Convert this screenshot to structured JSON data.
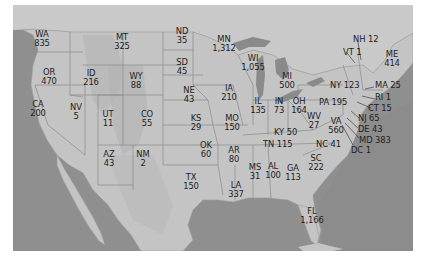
{
  "map": {
    "region": "United States",
    "colors": {
      "ocean": "#8f8f8f",
      "land": "#c4c4c4",
      "land_dark": "#b0b0b0",
      "lakes": "#8a8a8a",
      "border": "#7e7e7e",
      "text": "#1e1e1e"
    },
    "states": [
      {
        "abbr": "WA",
        "value": "835"
      },
      {
        "abbr": "OR",
        "value": "470"
      },
      {
        "abbr": "CA",
        "value": "200"
      },
      {
        "abbr": "ID",
        "value": "216"
      },
      {
        "abbr": "NV",
        "value": "5"
      },
      {
        "abbr": "MT",
        "value": "325"
      },
      {
        "abbr": "WY",
        "value": "88"
      },
      {
        "abbr": "UT",
        "value": "11"
      },
      {
        "abbr": "AZ",
        "value": "43"
      },
      {
        "abbr": "CO",
        "value": "55"
      },
      {
        "abbr": "NM",
        "value": "2"
      },
      {
        "abbr": "ND",
        "value": "35"
      },
      {
        "abbr": "SD",
        "value": "45"
      },
      {
        "abbr": "NE",
        "value": "43"
      },
      {
        "abbr": "KS",
        "value": "29"
      },
      {
        "abbr": "OK",
        "value": "60"
      },
      {
        "abbr": "TX",
        "value": "150"
      },
      {
        "abbr": "MN",
        "value": "1,312"
      },
      {
        "abbr": "IA",
        "value": "210"
      },
      {
        "abbr": "MO",
        "value": "150"
      },
      {
        "abbr": "AR",
        "value": "80"
      },
      {
        "abbr": "LA",
        "value": "337"
      },
      {
        "abbr": "WI",
        "value": "1,055"
      },
      {
        "abbr": "IL",
        "value": "135"
      },
      {
        "abbr": "MS",
        "value": "31"
      },
      {
        "abbr": "MI",
        "value": "500"
      },
      {
        "abbr": "IN",
        "value": "73"
      },
      {
        "abbr": "KY",
        "value": "50"
      },
      {
        "abbr": "TN",
        "value": "115"
      },
      {
        "abbr": "AL",
        "value": "100"
      },
      {
        "abbr": "OH",
        "value": "164"
      },
      {
        "abbr": "WV",
        "value": "27"
      },
      {
        "abbr": "GA",
        "value": "113"
      },
      {
        "abbr": "FL",
        "value": "1,166"
      },
      {
        "abbr": "SC",
        "value": "222"
      },
      {
        "abbr": "NC",
        "value": "41"
      },
      {
        "abbr": "VA",
        "value": "560"
      },
      {
        "abbr": "PA",
        "value": "195"
      },
      {
        "abbr": "NY",
        "value": "123"
      },
      {
        "abbr": "VT",
        "value": "1"
      },
      {
        "abbr": "NH",
        "value": "12"
      },
      {
        "abbr": "ME",
        "value": "414"
      },
      {
        "abbr": "MA",
        "value": "25"
      },
      {
        "abbr": "RI",
        "value": "1"
      },
      {
        "abbr": "CT",
        "value": "15"
      },
      {
        "abbr": "NJ",
        "value": "65"
      },
      {
        "abbr": "DE",
        "value": "43"
      },
      {
        "abbr": "MD",
        "value": "383"
      },
      {
        "abbr": "DC",
        "value": "1"
      }
    ]
  }
}
